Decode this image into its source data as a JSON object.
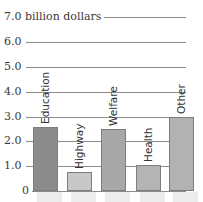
{
  "chart_data": {
    "type": "bar",
    "title": "",
    "xlabel": "",
    "ylabel": "billion dollars",
    "ylim": [
      0,
      7
    ],
    "yticks": [
      "0",
      "1.0",
      "2.0",
      "3.0",
      "4.0",
      "5.0",
      "6.0",
      "7.0 billion dollars"
    ],
    "categories": [
      "Education",
      "Highway",
      "Welfare",
      "Health",
      "Other"
    ],
    "values": [
      2.6,
      0.75,
      2.5,
      1.05,
      3.0
    ],
    "colors": [
      "#8c8c8c",
      "#c8c8c8",
      "#a8a8a8",
      "#b4b4b4",
      "#b2b2b2"
    ],
    "grid": true,
    "legend": null
  }
}
